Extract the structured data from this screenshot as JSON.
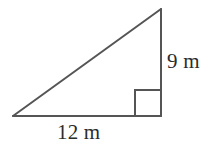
{
  "figure": {
    "type": "right-triangle-diagram",
    "background_color": "#ffffff",
    "stroke_color": "#555555",
    "stroke_width": 2,
    "text_color": "#2b2b2b",
    "canvas": {
      "width": 222,
      "height": 147
    },
    "vertices": {
      "left": {
        "x": 13,
        "y": 116
      },
      "apex": {
        "x": 161,
        "y": 9
      },
      "right_angle": {
        "x": 161,
        "y": 116
      }
    },
    "right_angle_marker": {
      "present": true,
      "size": 26,
      "corner_x": 161,
      "corner_y": 116
    },
    "labels": {
      "vertical_leg": "9 m",
      "horizontal_leg": "12 m"
    },
    "measurements": {
      "vertical_leg_value": 9,
      "horizontal_leg_value": 12,
      "units": "m"
    }
  }
}
